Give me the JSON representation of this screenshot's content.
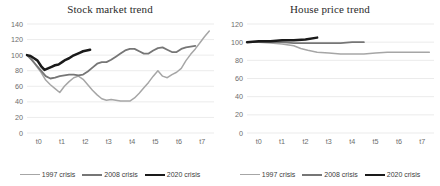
{
  "figure": {
    "background": "#ffffff",
    "panels": [
      "stock-market-trend",
      "house-price-trend"
    ]
  },
  "series_colors": {
    "crisis_1997": "#a6a6a6",
    "crisis_2008": "#767676",
    "crisis_2020": "#1a1a1a"
  },
  "legend": {
    "items": [
      {
        "label": "1997 crisis",
        "color": "#a6a6a6",
        "width": 1.6
      },
      {
        "label": "2008 crisis",
        "color": "#767676",
        "width": 2.0
      },
      {
        "label": "2020 crisis",
        "color": "#1a1a1a",
        "width": 2.6
      }
    ]
  },
  "chart_data": [
    {
      "id": "stock-market-trend",
      "type": "line",
      "title": "Stock market trend",
      "xlabel": "",
      "ylabel": "",
      "x": [
        "t0",
        "t1",
        "t2",
        "t3",
        "t4",
        "t5",
        "t6",
        "t7"
      ],
      "xlim": [
        0,
        8
      ],
      "ylim": [
        0,
        140
      ],
      "yticks": [
        0,
        20,
        40,
        60,
        80,
        100,
        120,
        140
      ],
      "xticks": [
        "t0",
        "t1",
        "t2",
        "t3",
        "t4",
        "t5",
        "t6",
        "t7"
      ],
      "grid": "horizontal",
      "legend_position": "bottom",
      "series": [
        {
          "name": "1997 crisis",
          "color": "#a6a6a6",
          "points": [
            [
              0.0,
              100
            ],
            [
              0.2,
              95
            ],
            [
              0.4,
              86
            ],
            [
              0.6,
              78
            ],
            [
              0.8,
              68
            ],
            [
              1.0,
              62
            ],
            [
              1.2,
              57
            ],
            [
              1.4,
              52
            ],
            [
              1.6,
              60
            ],
            [
              1.8,
              66
            ],
            [
              2.0,
              71
            ],
            [
              2.2,
              73
            ],
            [
              2.4,
              69
            ],
            [
              2.6,
              62
            ],
            [
              2.8,
              55
            ],
            [
              3.0,
              49
            ],
            [
              3.2,
              44
            ],
            [
              3.4,
              42
            ],
            [
              3.6,
              43
            ],
            [
              3.8,
              42
            ],
            [
              4.0,
              41
            ],
            [
              4.2,
              41
            ],
            [
              4.4,
              41
            ],
            [
              4.6,
              45
            ],
            [
              4.8,
              51
            ],
            [
              5.0,
              58
            ],
            [
              5.2,
              65
            ],
            [
              5.4,
              73
            ],
            [
              5.6,
              80
            ],
            [
              5.8,
              73
            ],
            [
              6.0,
              71
            ],
            [
              6.2,
              75
            ],
            [
              6.4,
              78
            ],
            [
              6.6,
              83
            ],
            [
              6.8,
              93
            ],
            [
              7.0,
              101
            ],
            [
              7.2,
              108
            ],
            [
              7.4,
              116
            ],
            [
              7.6,
              124
            ],
            [
              7.8,
              131
            ]
          ]
        },
        {
          "name": "2008 crisis",
          "color": "#767676",
          "points": [
            [
              0.0,
              100
            ],
            [
              0.2,
              94
            ],
            [
              0.4,
              87
            ],
            [
              0.6,
              80
            ],
            [
              0.8,
              73
            ],
            [
              1.0,
              70
            ],
            [
              1.2,
              71
            ],
            [
              1.4,
              73
            ],
            [
              1.6,
              74
            ],
            [
              1.8,
              75
            ],
            [
              2.0,
              75
            ],
            [
              2.2,
              74
            ],
            [
              2.4,
              75
            ],
            [
              2.6,
              79
            ],
            [
              2.8,
              84
            ],
            [
              3.0,
              89
            ],
            [
              3.2,
              91
            ],
            [
              3.4,
              91
            ],
            [
              3.6,
              94
            ],
            [
              3.8,
              98
            ],
            [
              4.0,
              102
            ],
            [
              4.2,
              106
            ],
            [
              4.4,
              108
            ],
            [
              4.6,
              108
            ],
            [
              4.8,
              105
            ],
            [
              5.0,
              102
            ],
            [
              5.2,
              102
            ],
            [
              5.4,
              106
            ],
            [
              5.6,
              109
            ],
            [
              5.8,
              110
            ],
            [
              6.0,
              107
            ],
            [
              6.2,
              104
            ],
            [
              6.4,
              104
            ],
            [
              6.6,
              108
            ],
            [
              6.8,
              110
            ],
            [
              7.0,
              111
            ],
            [
              7.2,
              112
            ]
          ]
        },
        {
          "name": "2020 crisis",
          "color": "#1a1a1a",
          "points": [
            [
              0.0,
              100
            ],
            [
              0.15,
              99
            ],
            [
              0.3,
              96
            ],
            [
              0.45,
              93
            ],
            [
              0.6,
              86
            ],
            [
              0.75,
              81
            ],
            [
              0.9,
              83
            ],
            [
              1.05,
              85
            ],
            [
              1.2,
              87
            ],
            [
              1.35,
              88
            ],
            [
              1.5,
              91
            ],
            [
              1.65,
              94
            ],
            [
              1.8,
              96
            ],
            [
              1.95,
              99
            ],
            [
              2.1,
              101
            ],
            [
              2.25,
              103
            ],
            [
              2.4,
              105
            ],
            [
              2.55,
              106
            ],
            [
              2.7,
              107
            ]
          ]
        }
      ]
    },
    {
      "id": "house-price-trend",
      "type": "line",
      "title": "House price trend",
      "xlabel": "",
      "ylabel": "",
      "x": [
        "t0",
        "t1",
        "t2",
        "t3",
        "t4",
        "t5",
        "t6",
        "t7"
      ],
      "xlim": [
        0,
        8
      ],
      "ylim": [
        0,
        120
      ],
      "yticks": [
        0,
        20,
        40,
        60,
        80,
        100,
        120
      ],
      "xticks": [
        "t0",
        "t1",
        "t2",
        "t3",
        "t4",
        "t5",
        "t6",
        "t7"
      ],
      "grid": "horizontal",
      "legend_position": "bottom",
      "series": [
        {
          "name": "1997 crisis",
          "color": "#a6a6a6",
          "points": [
            [
              0.0,
              100
            ],
            [
              0.5,
              100
            ],
            [
              1.0,
              99
            ],
            [
              1.5,
              98
            ],
            [
              2.0,
              96
            ],
            [
              2.3,
              93
            ],
            [
              2.6,
              91
            ],
            [
              3.0,
              89
            ],
            [
              3.5,
              88
            ],
            [
              4.0,
              87
            ],
            [
              4.5,
              87
            ],
            [
              5.0,
              87
            ],
            [
              5.5,
              88
            ],
            [
              6.0,
              89
            ],
            [
              6.5,
              89
            ],
            [
              7.0,
              89
            ],
            [
              7.5,
              89
            ],
            [
              7.8,
              89
            ]
          ]
        },
        {
          "name": "2008 crisis",
          "color": "#767676",
          "points": [
            [
              0.0,
              100
            ],
            [
              0.5,
              100
            ],
            [
              1.0,
              100
            ],
            [
              1.5,
              100
            ],
            [
              2.0,
              99
            ],
            [
              2.5,
              99
            ],
            [
              3.0,
              99
            ],
            [
              3.5,
              99
            ],
            [
              4.0,
              99
            ],
            [
              4.5,
              100
            ],
            [
              5.0,
              100
            ]
          ]
        },
        {
          "name": "2020 crisis",
          "color": "#1a1a1a",
          "points": [
            [
              0.0,
              100
            ],
            [
              0.5,
              101
            ],
            [
              1.0,
              101
            ],
            [
              1.5,
              102
            ],
            [
              2.0,
              102
            ],
            [
              2.5,
              103
            ],
            [
              3.0,
              105
            ]
          ]
        }
      ]
    }
  ]
}
